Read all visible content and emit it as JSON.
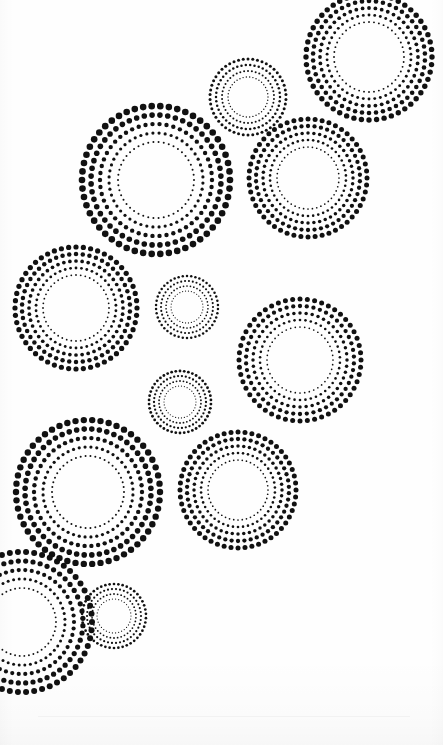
{
  "page": {
    "width": 443,
    "height": 745,
    "background_color": "#fefefe",
    "ink_color": "#111111",
    "medium": "scanned halftone dot artwork"
  },
  "artwork": {
    "ink_color": "#111111",
    "ring_count": 11,
    "rings": [
      {
        "id": "ring-top-right",
        "name": "top-right-large-ring",
        "cx": 369,
        "cy": 57,
        "clipped_edge": "top",
        "bands": [
          {
            "radius": 35,
            "dot_radius": 0.95,
            "count": 44
          },
          {
            "radius": 42,
            "dot_radius": 1.45,
            "count": 46
          },
          {
            "radius": 49,
            "dot_radius": 1.9,
            "count": 48
          },
          {
            "radius": 56,
            "dot_radius": 2.3,
            "count": 50
          },
          {
            "radius": 63,
            "dot_radius": 2.7,
            "count": 52
          }
        ]
      },
      {
        "id": "ring-top-small",
        "name": "top-small-ring",
        "cx": 248,
        "cy": 97,
        "clipped_edge": "none",
        "bands": [
          {
            "radius": 20,
            "dot_radius": 0.7,
            "count": 38
          },
          {
            "radius": 26,
            "dot_radius": 1.0,
            "count": 42
          },
          {
            "radius": 32,
            "dot_radius": 1.25,
            "count": 46
          },
          {
            "radius": 38,
            "dot_radius": 1.5,
            "count": 50
          }
        ]
      },
      {
        "id": "ring-upper-left-large",
        "name": "upper-left-largest-ring",
        "cx": 156,
        "cy": 180,
        "clipped_edge": "none",
        "bands": [
          {
            "radius": 38,
            "dot_radius": 1.0,
            "count": 46
          },
          {
            "radius": 47,
            "dot_radius": 1.6,
            "count": 48
          },
          {
            "radius": 56,
            "dot_radius": 2.2,
            "count": 50
          },
          {
            "radius": 65,
            "dot_radius": 2.8,
            "count": 52
          },
          {
            "radius": 74,
            "dot_radius": 3.3,
            "count": 54
          }
        ]
      },
      {
        "id": "ring-upper-right-mid",
        "name": "upper-right-medium-ring",
        "cx": 308,
        "cy": 178,
        "clipped_edge": "none",
        "bands": [
          {
            "radius": 31,
            "dot_radius": 0.85,
            "count": 44
          },
          {
            "radius": 38,
            "dot_radius": 1.3,
            "count": 46
          },
          {
            "radius": 45,
            "dot_radius": 1.75,
            "count": 48
          },
          {
            "radius": 52,
            "dot_radius": 2.15,
            "count": 50
          },
          {
            "radius": 59,
            "dot_radius": 2.5,
            "count": 52
          }
        ]
      },
      {
        "id": "ring-mid-left",
        "name": "middle-left-ring",
        "cx": 76,
        "cy": 308,
        "clipped_edge": "left",
        "bands": [
          {
            "radius": 33,
            "dot_radius": 0.9,
            "count": 44
          },
          {
            "radius": 40,
            "dot_radius": 1.4,
            "count": 46
          },
          {
            "radius": 47,
            "dot_radius": 1.85,
            "count": 48
          },
          {
            "radius": 54,
            "dot_radius": 2.25,
            "count": 50
          },
          {
            "radius": 61,
            "dot_radius": 2.6,
            "count": 52
          }
        ]
      },
      {
        "id": "ring-center-small-upper",
        "name": "center-small-ring-upper",
        "cx": 187,
        "cy": 307,
        "clipped_edge": "none",
        "bands": [
          {
            "radius": 16,
            "dot_radius": 0.6,
            "count": 34
          },
          {
            "radius": 21,
            "dot_radius": 0.85,
            "count": 38
          },
          {
            "radius": 26,
            "dot_radius": 1.05,
            "count": 42
          },
          {
            "radius": 31,
            "dot_radius": 1.25,
            "count": 46
          }
        ]
      },
      {
        "id": "ring-mid-right",
        "name": "middle-right-ring",
        "cx": 300,
        "cy": 360,
        "clipped_edge": "none",
        "bands": [
          {
            "radius": 33,
            "dot_radius": 0.85,
            "count": 44
          },
          {
            "radius": 40,
            "dot_radius": 1.3,
            "count": 46
          },
          {
            "radius": 47,
            "dot_radius": 1.75,
            "count": 48
          },
          {
            "radius": 54,
            "dot_radius": 2.15,
            "count": 50
          },
          {
            "radius": 61,
            "dot_radius": 2.5,
            "count": 52
          }
        ]
      },
      {
        "id": "ring-center-small-lower",
        "name": "center-small-ring-lower",
        "cx": 180,
        "cy": 402,
        "clipped_edge": "none",
        "bands": [
          {
            "radius": 16,
            "dot_radius": 0.6,
            "count": 34
          },
          {
            "radius": 21,
            "dot_radius": 0.9,
            "count": 38
          },
          {
            "radius": 26,
            "dot_radius": 1.15,
            "count": 42
          },
          {
            "radius": 31,
            "dot_radius": 1.4,
            "count": 46
          }
        ]
      },
      {
        "id": "ring-lower-left-large",
        "name": "lower-left-large-ring",
        "cx": 88,
        "cy": 492,
        "clipped_edge": "none",
        "bands": [
          {
            "radius": 36,
            "dot_radius": 1.0,
            "count": 46
          },
          {
            "radius": 45,
            "dot_radius": 1.6,
            "count": 48
          },
          {
            "radius": 54,
            "dot_radius": 2.2,
            "count": 50
          },
          {
            "radius": 63,
            "dot_radius": 2.8,
            "count": 52
          },
          {
            "radius": 72,
            "dot_radius": 3.2,
            "count": 54
          }
        ]
      },
      {
        "id": "ring-lower-right",
        "name": "lower-right-ring",
        "cx": 238,
        "cy": 490,
        "clipped_edge": "none",
        "bands": [
          {
            "radius": 30,
            "dot_radius": 0.85,
            "count": 44
          },
          {
            "radius": 37,
            "dot_radius": 1.3,
            "count": 46
          },
          {
            "radius": 44,
            "dot_radius": 1.75,
            "count": 48
          },
          {
            "radius": 51,
            "dot_radius": 2.15,
            "count": 50
          },
          {
            "radius": 58,
            "dot_radius": 2.5,
            "count": 52
          }
        ]
      },
      {
        "id": "ring-bottom-left-partial",
        "name": "bottom-left-partial-ring",
        "cx": 22,
        "cy": 622,
        "clipped_edge": "left",
        "bands": [
          {
            "radius": 34,
            "dot_radius": 0.95,
            "count": 46
          },
          {
            "radius": 43,
            "dot_radius": 1.5,
            "count": 48
          },
          {
            "radius": 52,
            "dot_radius": 2.1,
            "count": 50
          },
          {
            "radius": 61,
            "dot_radius": 2.6,
            "count": 52
          },
          {
            "radius": 70,
            "dot_radius": 3.0,
            "count": 54
          }
        ]
      },
      {
        "id": "ring-bottom-small",
        "name": "bottom-small-ring",
        "cx": 114,
        "cy": 616,
        "clipped_edge": "none",
        "bands": [
          {
            "radius": 17,
            "dot_radius": 0.6,
            "count": 34
          },
          {
            "radius": 22,
            "dot_radius": 0.9,
            "count": 38
          },
          {
            "radius": 27,
            "dot_radius": 1.1,
            "count": 42
          },
          {
            "radius": 32,
            "dot_radius": 1.35,
            "count": 46
          }
        ]
      }
    ]
  }
}
